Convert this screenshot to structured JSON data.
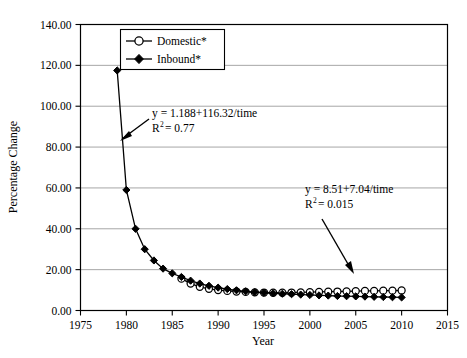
{
  "chart_data": {
    "type": "line",
    "title": "",
    "xlabel": "Year",
    "ylabel": "Percentage Change",
    "xlim": [
      1975,
      2015
    ],
    "ylim": [
      0,
      140
    ],
    "xticks": [
      1975,
      1980,
      1985,
      1990,
      1995,
      2000,
      2005,
      2010,
      2015
    ],
    "xtick_labels": [
      "1975",
      "1980",
      "1985",
      "1990",
      "1995",
      "2000",
      "2005",
      "2010",
      "2015"
    ],
    "yticks": [
      0,
      20,
      40,
      60,
      80,
      100,
      120,
      140
    ],
    "ytick_labels": [
      "0.00",
      "20.00",
      "40.00",
      "60.00",
      "80.00",
      "100.00",
      "120.00",
      "140.00"
    ],
    "grid": "horizontal",
    "legend_position": "top-left-inside",
    "series": [
      {
        "name": "Domestic*",
        "marker": "open-circle",
        "x": [
          1986,
          1987,
          1988,
          1989,
          1990,
          1991,
          1992,
          1993,
          1994,
          1995,
          1996,
          1997,
          1998,
          1999,
          2000,
          2001,
          2002,
          2003,
          2004,
          2005,
          2006,
          2007,
          2008,
          2009,
          2010
        ],
        "values": [
          15.6,
          13.2,
          11.6,
          10.6,
          10.0,
          9.6,
          9.3,
          9.1,
          8.9,
          8.8,
          8.7,
          8.7,
          8.8,
          8.9,
          9.0,
          9.1,
          9.2,
          9.3,
          9.4,
          9.5,
          9.6,
          9.6,
          9.7,
          9.7,
          9.8
        ]
      },
      {
        "name": "Inbound*",
        "marker": "filled-diamond",
        "x": [
          1979,
          1980,
          1981,
          1982,
          1983,
          1984,
          1985,
          1986,
          1987,
          1988,
          1989,
          1990,
          1991,
          1992,
          1993,
          1994,
          1995,
          1996,
          1997,
          1998,
          1999,
          2000,
          2001,
          2002,
          2003,
          2004,
          2005,
          2006,
          2007,
          2008,
          2009,
          2010
        ],
        "values": [
          117.5,
          59.0,
          40.0,
          30.0,
          24.5,
          20.5,
          18.2,
          16.4,
          14.6,
          13.2,
          12.1,
          11.2,
          10.5,
          9.9,
          9.4,
          9.0,
          8.7,
          8.4,
          8.2,
          8.0,
          7.8,
          7.6,
          7.4,
          7.3,
          7.1,
          7.0,
          6.9,
          6.8,
          6.7,
          6.6,
          6.5,
          6.4
        ]
      }
    ],
    "annotations": [
      {
        "id": "domestic-fit",
        "equation": "y = 1.188+116.32/time",
        "r_squared_label": "R",
        "r_squared_exponent": "2",
        "r_squared_value": "= 0.77",
        "arrow": "down-left"
      },
      {
        "id": "inbound-fit",
        "equation": "y = 8.51+7.04/time",
        "r_squared_label": "R",
        "r_squared_exponent": "2",
        "r_squared_value": "= 0.015",
        "arrow": "down-right"
      }
    ],
    "colors": {
      "line": "#000000",
      "grid": "#808080",
      "axis": "#000000",
      "background": "#ffffff",
      "marker_fill_open": "#ffffff",
      "marker_fill_solid": "#000000"
    }
  }
}
